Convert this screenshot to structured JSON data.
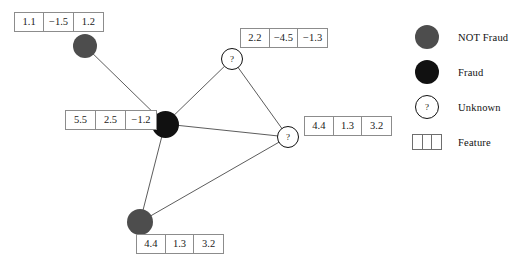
{
  "diagram": {
    "background": "#ffffff",
    "edge_color": "#4a4a4a"
  },
  "colors": {
    "not_fraud": "#4d4d4d",
    "fraud": "#111111",
    "unknown_fill": "#ffffff",
    "unknown_stroke": "#111111",
    "box_border": "#8c8c8c",
    "text": "#111111"
  },
  "nodes": [
    {
      "id": "n1",
      "type": "not-fraud",
      "label": "",
      "cx": 85,
      "cy": 46,
      "r": 12,
      "features": [
        "1.1",
        "−1.5",
        "1.2"
      ],
      "feature_box": {
        "x": 14,
        "y": 12,
        "w": 90,
        "h": 20
      }
    },
    {
      "id": "n2",
      "type": "fraud",
      "label": "",
      "cx": 165,
      "cy": 124,
      "r": 13.5,
      "features": [
        "5.5",
        "2.5",
        "−1.2"
      ],
      "feature_box": {
        "x": 65,
        "y": 110,
        "w": 92,
        "h": 20
      }
    },
    {
      "id": "n3",
      "type": "unknown",
      "label": "?",
      "cx": 232,
      "cy": 59,
      "r": 11,
      "features": [
        "2.2",
        "−4.5",
        "−1.3"
      ],
      "feature_box": {
        "x": 240,
        "y": 28,
        "w": 88,
        "h": 20
      }
    },
    {
      "id": "n4",
      "type": "unknown",
      "label": "?",
      "cx": 288,
      "cy": 137,
      "r": 11,
      "features": [
        "4.4",
        "1.3",
        "3.2"
      ],
      "feature_box": {
        "x": 304,
        "y": 116,
        "w": 88,
        "h": 20
      }
    },
    {
      "id": "n5",
      "type": "not-fraud",
      "label": "",
      "cx": 140,
      "cy": 222,
      "r": 13,
      "features": [
        "4.4",
        "1.3",
        "3.2"
      ],
      "feature_box": {
        "x": 136,
        "y": 234,
        "w": 88,
        "h": 20
      }
    }
  ],
  "edges": [
    {
      "from": "n1",
      "to": "n2"
    },
    {
      "from": "n2",
      "to": "n3"
    },
    {
      "from": "n2",
      "to": "n4"
    },
    {
      "from": "n2",
      "to": "n5"
    },
    {
      "from": "n3",
      "to": "n4"
    },
    {
      "from": "n4",
      "to": "n5"
    }
  ],
  "legend": {
    "items": [
      {
        "marker": "gray-circle",
        "label": "NOT Fraud",
        "top": 10
      },
      {
        "marker": "black-circle",
        "label": "Fraud",
        "top": 45
      },
      {
        "marker": "unknown-circle",
        "label": "Unknown",
        "top": 80,
        "glyph": "?"
      },
      {
        "marker": "feature-box",
        "label": "Feature",
        "top": 115
      }
    ]
  }
}
